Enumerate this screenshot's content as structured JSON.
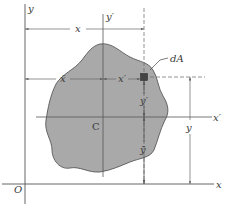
{
  "diagram": {
    "colors": {
      "background": "#ffffff",
      "area_fill": "#a9a9a9",
      "outline": "#4a4a4a",
      "axis": "#555555",
      "dim_line": "#666666",
      "text": "#3a3a3a"
    },
    "labels": {
      "y_axis": "y",
      "x_axis": "x",
      "origin": "O",
      "y_prime_axis": "y′",
      "x_prime_axis": "x′",
      "centroid": "C",
      "element": "dA",
      "dim_x": "x",
      "dim_x_bar": "x̄",
      "dim_x_prime": "x′",
      "dim_y_prime": "y′",
      "dim_y_bar": "ȳ",
      "dim_y": "y"
    }
  }
}
